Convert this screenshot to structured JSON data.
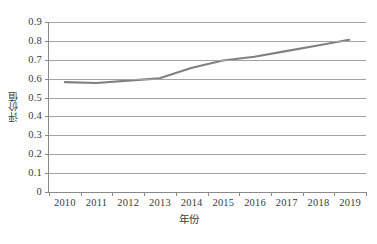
{
  "chart_data": {
    "type": "line",
    "title": "",
    "xlabel": "年份",
    "ylabel": "评价值",
    "categories": [
      "2010",
      "2011",
      "2012",
      "2013",
      "2014",
      "2015",
      "2016",
      "2017",
      "2018",
      "2019"
    ],
    "x": [
      2010,
      2011,
      2012,
      2013,
      2014,
      2015,
      2016,
      2017,
      2018,
      2019
    ],
    "series": [
      {
        "name": "评价值",
        "color": "#808080",
        "values": [
          0.58,
          0.575,
          0.588,
          0.6,
          0.655,
          0.695,
          0.715,
          0.745,
          0.775,
          0.805
        ]
      }
    ],
    "ylim": [
      0,
      0.9
    ],
    "yticks": [
      "0",
      "0.1",
      "0.2",
      "0.3",
      "0.4",
      "0.5",
      "0.6",
      "0.7",
      "0.8",
      "0.9"
    ],
    "ytick_values": [
      0,
      0.1,
      0.2,
      0.3,
      0.4,
      0.5,
      0.6,
      0.7,
      0.8,
      0.9
    ],
    "grid": "horizontal",
    "legend": "none",
    "axis_color": "#8a8a8a",
    "gridline_color": "#a2a2a2",
    "background": "#ffffff"
  }
}
